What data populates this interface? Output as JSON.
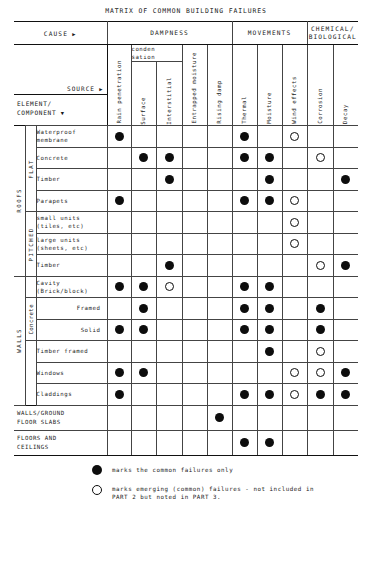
{
  "title": "MATRIX OF COMMON BUILDING FAILURES",
  "headers": {
    "cause": "CAUSE",
    "source": "SOURCE",
    "element": "ELEMENT/",
    "element2": "COMPONENT",
    "groups": [
      {
        "label": "DAMPNESS",
        "span": 5
      },
      {
        "label": "MOVEMENTS",
        "span": 3
      },
      {
        "label": "CHEMICAL/",
        "label2": "BIOLOGICAL",
        "span": 2
      }
    ],
    "condensation": {
      "line1": "conden",
      "line2": "sation"
    },
    "columns": [
      "Rain penetration",
      "Surface",
      "Interstitial",
      "Entrapped moisture",
      "Rising damp",
      "Thermal",
      "Moisture",
      "Wind effects",
      "Corrosion",
      "Decay"
    ]
  },
  "sections": [
    {
      "name": "ROOFS",
      "subgroups": [
        {
          "name": "FLAT",
          "rows": [
            {
              "label": "Waterproof",
              "label2": "membrane",
              "marks": [
                "dot",
                "",
                "",
                "",
                "",
                "dot",
                "",
                "ring",
                "",
                ""
              ]
            },
            {
              "label": "Concrete",
              "label2": "",
              "marks": [
                "",
                "dot",
                "dot",
                "",
                "",
                "dot",
                "dot",
                "",
                "ring",
                ""
              ]
            },
            {
              "label": "Timber",
              "label2": "",
              "marks": [
                "",
                "",
                "dot",
                "",
                "",
                "",
                "dot",
                "",
                "",
                "dot"
              ]
            },
            {
              "label": "Parapets",
              "label2": "",
              "marks": [
                "dot",
                "",
                "",
                "",
                "",
                "dot",
                "dot",
                "ring",
                "",
                ""
              ]
            }
          ]
        },
        {
          "name": "PITCHED",
          "rows": [
            {
              "label": "small units",
              "label2": "(tiles, etc)",
              "marks": [
                "",
                "",
                "",
                "",
                "",
                "",
                "",
                "ring",
                "",
                ""
              ]
            },
            {
              "label": "large units",
              "label2": "(sheets, etc)",
              "marks": [
                "",
                "",
                "",
                "",
                "",
                "",
                "",
                "ring",
                "",
                ""
              ]
            },
            {
              "label": "Timber",
              "label2": "",
              "marks": [
                "",
                "",
                "dot",
                "",
                "",
                "",
                "",
                "",
                "ring",
                "dot"
              ]
            }
          ]
        }
      ]
    },
    {
      "name": "WALLS",
      "subgroups": [
        {
          "name": "",
          "rows": [
            {
              "label": "Cavity",
              "label2": "(Brick/block)",
              "marks": [
                "dot",
                "dot",
                "ring",
                "",
                "",
                "dot",
                "dot",
                "",
                "",
                ""
              ]
            }
          ]
        },
        {
          "name": "Concrete",
          "rows": [
            {
              "label": "Framed",
              "label2": "",
              "align": "right",
              "marks": [
                "",
                "dot",
                "",
                "",
                "",
                "dot",
                "dot",
                "",
                "dot",
                ""
              ]
            },
            {
              "label": "Solid",
              "label2": "",
              "align": "right",
              "marks": [
                "dot",
                "dot",
                "",
                "",
                "",
                "dot",
                "dot",
                "",
                "dot",
                ""
              ]
            }
          ]
        },
        {
          "name": "",
          "rows": [
            {
              "label": "Timber framed",
              "label2": "",
              "marks": [
                "",
                "",
                "",
                "",
                "",
                "",
                "dot",
                "",
                "ring",
                ""
              ]
            },
            {
              "label": "Windows",
              "label2": "",
              "marks": [
                "dot",
                "dot",
                "",
                "",
                "",
                "",
                "",
                "ring",
                "ring",
                "dot"
              ]
            },
            {
              "label": "Claddings",
              "label2": "",
              "marks": [
                "dot",
                "",
                "",
                "",
                "",
                "dot",
                "dot",
                "ring",
                "dot",
                "dot"
              ]
            }
          ]
        }
      ]
    }
  ],
  "full_rows": [
    {
      "label": "WALLS/GROUND",
      "label2": "FLOOR SLABS",
      "marks": [
        "",
        "",
        "",
        "",
        "dot",
        "",
        "",
        "",
        "",
        ""
      ]
    },
    {
      "label": "FLOORS AND",
      "label2": "CEILINGS",
      "marks": [
        "",
        "",
        "",
        "",
        "",
        "dot",
        "dot",
        "",
        "",
        ""
      ]
    }
  ],
  "legend": [
    {
      "symbol": "dot",
      "text": "marks the common failures only",
      "text2": ""
    },
    {
      "symbol": "ring",
      "text": "marks emerging (common) failures - not included in",
      "text2": "PART 2 but noted in PART 3."
    }
  ]
}
